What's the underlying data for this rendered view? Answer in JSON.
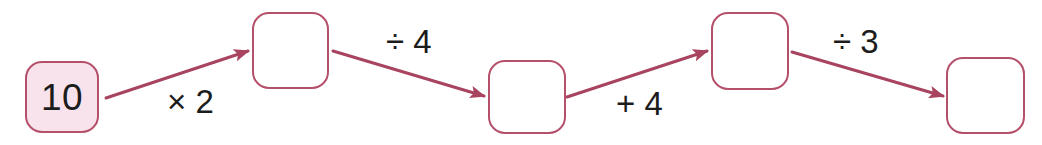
{
  "diagram": {
    "type": "function-machine-chain",
    "title": "",
    "start_value": "10",
    "nodes": [
      {
        "id": "node-1",
        "value": "10",
        "filled": true,
        "x": 25,
        "y": 61,
        "w": 74,
        "h": 72
      },
      {
        "id": "node-2",
        "value": "",
        "filled": false,
        "x": 252,
        "y": 12,
        "w": 77,
        "h": 77
      },
      {
        "id": "node-3",
        "value": "",
        "filled": false,
        "x": 488,
        "y": 60,
        "w": 78,
        "h": 74
      },
      {
        "id": "node-4",
        "value": "",
        "filled": false,
        "x": 711,
        "y": 12,
        "w": 78,
        "h": 78
      },
      {
        "id": "node-5",
        "value": "",
        "filled": false,
        "x": 946,
        "y": 57,
        "w": 79,
        "h": 77
      }
    ],
    "operations": [
      {
        "id": "op-1",
        "label": "× 2",
        "x": 167,
        "y": 85,
        "from": "node-1",
        "to": "node-2"
      },
      {
        "id": "op-2",
        "label": "÷ 4",
        "x": 386,
        "y": 25,
        "from": "node-2",
        "to": "node-3"
      },
      {
        "id": "op-3",
        "label": "+ 4",
        "x": 616,
        "y": 87,
        "from": "node-3",
        "to": "node-4"
      },
      {
        "id": "op-4",
        "label": "÷ 3",
        "x": 833,
        "y": 25,
        "from": "node-4",
        "to": "node-5"
      }
    ],
    "arrows": [
      {
        "id": "arrow-1",
        "x1": 106,
        "y1": 98,
        "x2": 248,
        "y2": 51
      },
      {
        "id": "arrow-2",
        "x1": 333,
        "y1": 51,
        "x2": 484,
        "y2": 96
      },
      {
        "id": "arrow-3",
        "x1": 567,
        "y1": 97,
        "x2": 707,
        "y2": 51
      },
      {
        "id": "arrow-4",
        "x1": 792,
        "y1": 52,
        "x2": 943,
        "y2": 96
      }
    ],
    "colors": {
      "stroke": "#b5506b",
      "box_fill": "#f8e3ec",
      "text": "#1c1c1c",
      "background": "#ffffff"
    }
  }
}
